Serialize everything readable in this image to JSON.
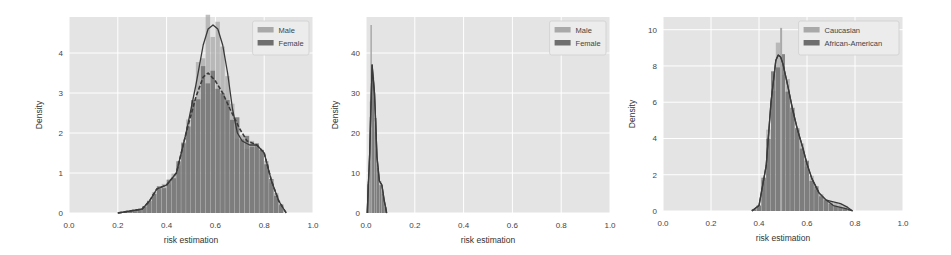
{
  "chart_data": [
    {
      "type": "histogram+kde",
      "title": "",
      "xlabel": "risk estimation",
      "ylabel": "Density",
      "xlim": [
        0.0,
        1.0
      ],
      "ylim": [
        0,
        4.9
      ],
      "xticks": [
        "0.0",
        "0.2",
        "0.4",
        "0.6",
        "0.8",
        "1.0"
      ],
      "yticks": [
        "0",
        "1",
        "2",
        "3",
        "4"
      ],
      "grid": true,
      "legend_position": "upper right",
      "series": [
        {
          "name": "Male",
          "color": "#a9a9a9",
          "kde_style": "solid",
          "x": [
            0.2,
            0.25,
            0.3,
            0.33,
            0.36,
            0.4,
            0.44,
            0.48,
            0.52,
            0.55,
            0.57,
            0.59,
            0.61,
            0.63,
            0.65,
            0.67,
            0.69,
            0.71,
            0.74,
            0.77,
            0.8,
            0.83,
            0.86,
            0.89
          ],
          "kde": [
            0.0,
            0.05,
            0.1,
            0.3,
            0.6,
            0.7,
            1.0,
            2.0,
            3.2,
            4.2,
            4.6,
            4.7,
            4.6,
            4.2,
            3.5,
            2.6,
            2.0,
            1.8,
            1.7,
            1.7,
            1.5,
            0.8,
            0.3,
            0.0
          ]
        },
        {
          "name": "Female",
          "color": "#6e6e6e",
          "kde_style": "dashed",
          "x": [
            0.2,
            0.25,
            0.3,
            0.33,
            0.36,
            0.4,
            0.44,
            0.48,
            0.52,
            0.55,
            0.57,
            0.6,
            0.63,
            0.66,
            0.7,
            0.73,
            0.77,
            0.8,
            0.83,
            0.86,
            0.89
          ],
          "kde": [
            0.0,
            0.05,
            0.1,
            0.3,
            0.6,
            0.7,
            1.0,
            2.0,
            2.9,
            3.4,
            3.5,
            3.3,
            3.0,
            2.6,
            2.1,
            1.8,
            1.7,
            1.5,
            0.8,
            0.3,
            0.0
          ]
        }
      ]
    },
    {
      "type": "histogram+kde",
      "title": "",
      "xlabel": "risk estimation",
      "ylabel": "Density",
      "xlim": [
        0.0,
        1.0
      ],
      "ylim": [
        0,
        49
      ],
      "xticks": [
        "0.0",
        "0.2",
        "0.4",
        "0.6",
        "0.8",
        "1.0"
      ],
      "yticks": [
        "0",
        "10",
        "20",
        "30",
        "40"
      ],
      "grid": true,
      "legend_position": "upper right",
      "series": [
        {
          "name": "Male",
          "color": "#a9a9a9",
          "kde_style": "solid",
          "x": [
            0.005,
            0.015,
            0.025,
            0.035,
            0.045,
            0.055,
            0.065,
            0.075,
            0.085
          ],
          "kde": [
            0,
            15,
            37,
            30,
            14,
            8,
            7,
            3,
            0
          ]
        },
        {
          "name": "Female",
          "color": "#6e6e6e",
          "kde_style": "solid",
          "x": [
            0.005,
            0.015,
            0.025,
            0.035,
            0.045,
            0.055,
            0.065,
            0.075,
            0.085
          ],
          "kde": [
            0,
            15,
            37,
            30,
            14,
            8,
            7,
            3,
            0
          ]
        }
      ],
      "annotations": [
        "Male histogram spike to ~47 near x=0.02"
      ]
    },
    {
      "type": "histogram+kde",
      "title": "",
      "xlabel": "risk estimation",
      "ylabel": "Density",
      "xlim": [
        0.0,
        1.0
      ],
      "ylim": [
        0,
        10.7
      ],
      "xticks": [
        "0.0",
        "0.2",
        "0.4",
        "0.6",
        "0.8",
        "1.0"
      ],
      "yticks": [
        "0",
        "2",
        "4",
        "6",
        "8",
        "10"
      ],
      "grid": true,
      "legend_position": "upper right",
      "series": [
        {
          "name": "Caucasian",
          "color": "#a9a9a9",
          "kde_style": "solid",
          "x": [
            0.37,
            0.4,
            0.43,
            0.45,
            0.47,
            0.48,
            0.49,
            0.5,
            0.52,
            0.54,
            0.56,
            0.58,
            0.6,
            0.62,
            0.65,
            0.68,
            0.71,
            0.74,
            0.77,
            0.79
          ],
          "kde": [
            0,
            0.3,
            2.5,
            6.0,
            8.3,
            8.6,
            8.5,
            8.1,
            6.9,
            5.6,
            4.5,
            3.6,
            2.6,
            1.8,
            1.0,
            0.6,
            0.5,
            0.4,
            0.2,
            0
          ]
        },
        {
          "name": "African-American",
          "color": "#6e6e6e",
          "kde_style": "solid",
          "x": [
            0.37,
            0.4,
            0.43,
            0.45,
            0.47,
            0.48,
            0.49,
            0.5,
            0.52,
            0.54,
            0.56,
            0.58,
            0.6,
            0.62,
            0.65,
            0.68,
            0.71,
            0.74,
            0.77,
            0.79
          ],
          "kde": [
            0,
            0.3,
            2.5,
            6.0,
            8.3,
            8.6,
            8.5,
            8.1,
            6.9,
            5.6,
            4.5,
            3.6,
            2.6,
            1.8,
            1.0,
            0.6,
            0.3,
            0.2,
            0.1,
            0
          ]
        }
      ],
      "annotations": [
        "Caucasian histogram spike to ~10.1 near x=0.49"
      ]
    }
  ],
  "panels": [
    {
      "ylabel": "Density",
      "xlabel": "risk estimation",
      "legend": [
        "Male",
        "Female"
      ]
    },
    {
      "ylabel": "Density",
      "xlabel": "risk estimation",
      "legend": [
        "Male",
        "Female"
      ]
    },
    {
      "ylabel": "Density",
      "xlabel": "risk estimation",
      "legend": [
        "Caucasian",
        "African-American"
      ]
    }
  ]
}
